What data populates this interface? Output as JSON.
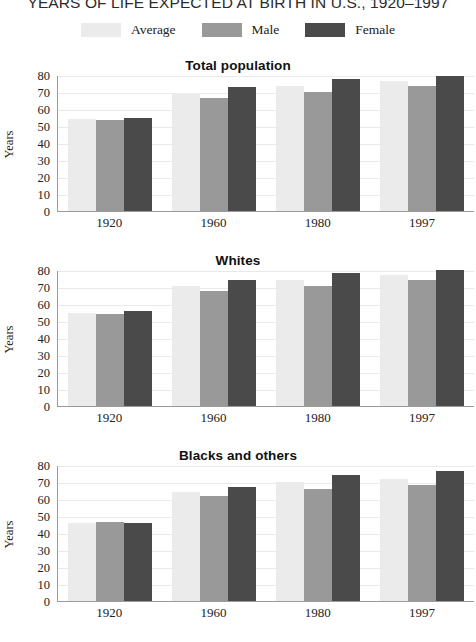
{
  "title": "YEARS OF LIFE EXPECTED AT BIRTH IN U.S., 1920–1997",
  "legend": {
    "entries": [
      {
        "label": "Average",
        "color": "#ebebeb"
      },
      {
        "label": "Male",
        "color": "#999999"
      },
      {
        "label": "Female",
        "color": "#4a4a4a"
      }
    ]
  },
  "axis": {
    "ylabel": "Years",
    "yticks": [
      "80",
      "70",
      "60",
      "50",
      "40",
      "30",
      "20",
      "10",
      "0"
    ],
    "xticks": [
      "1920",
      "1960",
      "1980",
      "1997"
    ]
  },
  "panels": [
    {
      "title": "Total population"
    },
    {
      "title": "Whites"
    },
    {
      "title": "Blacks and others"
    }
  ],
  "chart_data": [
    {
      "type": "bar",
      "title": "Total population",
      "xlabel": "",
      "ylabel": "Years",
      "ylim": [
        0,
        80
      ],
      "grid": true,
      "legend_position": "top",
      "categories": [
        "1920",
        "1960",
        "1980",
        "1997"
      ],
      "series": [
        {
          "name": "Average",
          "color": "#ebebeb",
          "values": [
            54.1,
            69.7,
            73.7,
            76.5
          ]
        },
        {
          "name": "Male",
          "color": "#999999",
          "values": [
            53.6,
            66.6,
            70.0,
            73.6
          ]
        },
        {
          "name": "Female",
          "color": "#4a4a4a",
          "values": [
            54.6,
            73.1,
            77.4,
            79.4
          ]
        }
      ]
    },
    {
      "type": "bar",
      "title": "Whites",
      "xlabel": "",
      "ylabel": "Years",
      "ylim": [
        0,
        80
      ],
      "grid": true,
      "legend_position": "top",
      "categories": [
        "1920",
        "1960",
        "1980",
        "1997"
      ],
      "series": [
        {
          "name": "Average",
          "color": "#ebebeb",
          "values": [
            54.9,
            70.6,
            74.4,
            77.1
          ]
        },
        {
          "name": "Male",
          "color": "#999999",
          "values": [
            54.4,
            67.4,
            70.7,
            74.3
          ]
        },
        {
          "name": "Female",
          "color": "#4a4a4a",
          "values": [
            55.6,
            74.1,
            78.1,
            79.9
          ]
        }
      ]
    },
    {
      "type": "bar",
      "title": "Blacks and others",
      "xlabel": "",
      "ylabel": "Years",
      "ylim": [
        0,
        80
      ],
      "grid": true,
      "legend_position": "top",
      "categories": [
        "1920",
        "1960",
        "1980",
        "1997"
      ],
      "series": [
        {
          "name": "Average",
          "color": "#ebebeb",
          "values": [
            46.0,
            64.1,
            70.3,
            71.8
          ]
        },
        {
          "name": "Male",
          "color": "#999999",
          "values": [
            46.3,
            61.5,
            66.0,
            68.5
          ]
        },
        {
          "name": "Female",
          "color": "#4a4a4a",
          "values": [
            45.9,
            67.0,
            74.0,
            76.3
          ]
        }
      ]
    }
  ]
}
